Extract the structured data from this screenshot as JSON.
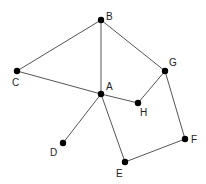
{
  "diagram": {
    "type": "undirected-graph",
    "nodes": [
      {
        "id": "A",
        "label": "A",
        "x": 101,
        "y": 94,
        "lx": 106,
        "ly": 90
      },
      {
        "id": "B",
        "label": "B",
        "x": 101,
        "y": 20,
        "lx": 106,
        "ly": 20
      },
      {
        "id": "C",
        "label": "C",
        "x": 17,
        "y": 71,
        "lx": 12,
        "ly": 86
      },
      {
        "id": "D",
        "label": "D",
        "x": 63,
        "y": 143,
        "lx": 50,
        "ly": 156
      },
      {
        "id": "E",
        "label": "E",
        "x": 125,
        "y": 162,
        "lx": 116,
        "ly": 177
      },
      {
        "id": "F",
        "label": "F",
        "x": 185,
        "y": 139,
        "lx": 191,
        "ly": 143
      },
      {
        "id": "G",
        "label": "G",
        "x": 165,
        "y": 71,
        "lx": 169,
        "ly": 66
      },
      {
        "id": "H",
        "label": "H",
        "x": 138,
        "y": 103,
        "lx": 140,
        "ly": 116
      }
    ],
    "edges": [
      [
        "B",
        "C"
      ],
      [
        "B",
        "A"
      ],
      [
        "B",
        "G"
      ],
      [
        "C",
        "A"
      ],
      [
        "A",
        "H"
      ],
      [
        "H",
        "G"
      ],
      [
        "G",
        "F"
      ],
      [
        "F",
        "E"
      ],
      [
        "E",
        "A"
      ],
      [
        "A",
        "D"
      ]
    ]
  }
}
